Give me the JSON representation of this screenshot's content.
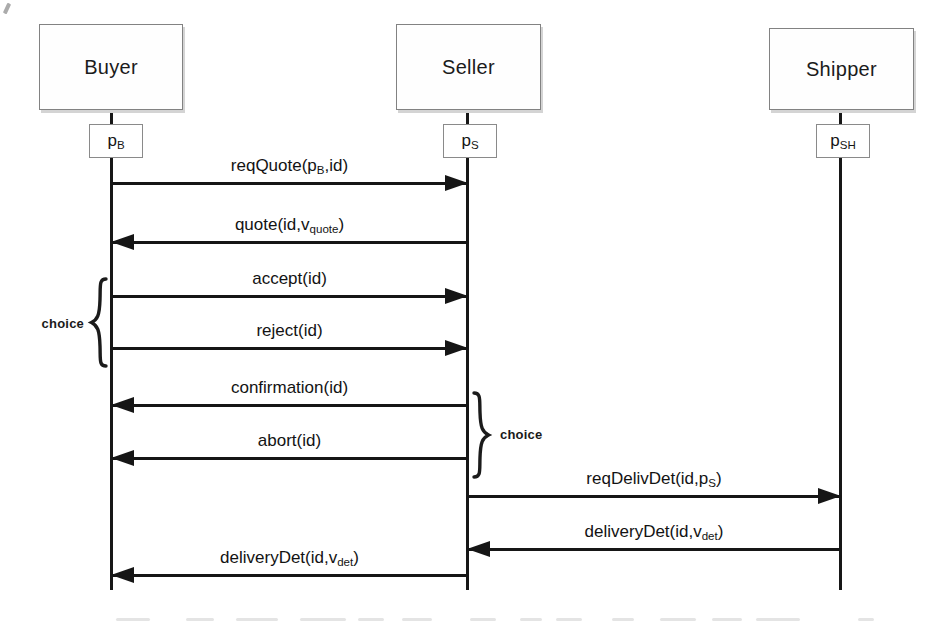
{
  "diagram_type": "message-sequence-diagram",
  "colors": {
    "background": "#ffffff",
    "line": "#161616",
    "box_border": "#828282",
    "box_shadow": "#d4d4d4",
    "text": "#151515"
  },
  "participants": [
    {
      "label": "Buyer",
      "process": {
        "base": "p",
        "sub": "B"
      }
    },
    {
      "label": "Seller",
      "process": {
        "base": "p",
        "sub": "S"
      }
    },
    {
      "label": "Shipper",
      "process": {
        "base": "p",
        "sub": "SH"
      }
    }
  ],
  "messages": [
    {
      "from": "Buyer",
      "to": "Seller",
      "direction": "right",
      "label": {
        "pre": "reqQuote(p",
        "sub": "B",
        "post": ",id)"
      }
    },
    {
      "from": "Seller",
      "to": "Buyer",
      "direction": "left",
      "label": {
        "pre": "quote(id,v",
        "sub": "quote",
        "post": ")"
      }
    },
    {
      "from": "Buyer",
      "to": "Seller",
      "direction": "right",
      "label": {
        "pre": "accept(id)",
        "sub": "",
        "post": ""
      }
    },
    {
      "from": "Buyer",
      "to": "Seller",
      "direction": "right",
      "label": {
        "pre": "reject(id)",
        "sub": "",
        "post": ""
      }
    },
    {
      "from": "Seller",
      "to": "Buyer",
      "direction": "left",
      "label": {
        "pre": "confirmation(id)",
        "sub": "",
        "post": ""
      }
    },
    {
      "from": "Seller",
      "to": "Buyer",
      "direction": "left",
      "label": {
        "pre": "abort(id)",
        "sub": "",
        "post": ""
      }
    },
    {
      "from": "Seller",
      "to": "Shipper",
      "direction": "right",
      "label": {
        "pre": "reqDelivDet(id,p",
        "sub": "S",
        "post": ")"
      }
    },
    {
      "from": "Shipper",
      "to": "Seller",
      "direction": "left",
      "label": {
        "pre": "deliveryDet(id,v",
        "sub": "det",
        "post": ")"
      }
    },
    {
      "from": "Seller",
      "to": "Buyer",
      "direction": "left",
      "label": {
        "pre": "deliveryDet(id,v",
        "sub": "det",
        "post": ")"
      }
    }
  ],
  "annotations": [
    {
      "text": "choice",
      "side": "left",
      "covers": "accept(id) / reject(id)"
    },
    {
      "text": "choice",
      "side": "right",
      "covers": "confirmation(id) / abort(id)"
    }
  ]
}
